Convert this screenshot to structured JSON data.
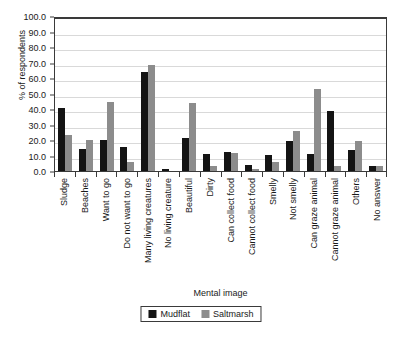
{
  "chart_data": {
    "type": "bar",
    "title": "",
    "xlabel": "Mental image",
    "ylabel": "% of respondents",
    "ylim": [
      0,
      100
    ],
    "ytick_step": 10,
    "ytick_labels": [
      "100.0",
      "90.0",
      "80.0",
      "70.0",
      "60.0",
      "50.0",
      "40.0",
      "30.0",
      "20.0",
      "10.0",
      "0.0"
    ],
    "ytick_values": [
      100,
      90,
      80,
      70,
      60,
      50,
      40,
      30,
      20,
      10,
      0
    ],
    "grid": true,
    "legend_position": "bottom-center",
    "categories": [
      "Sludge",
      "Beaches",
      "Want to go",
      "Do not want to go",
      "Many living creatures",
      "No living creature",
      "Beautiful",
      "Dirty",
      "Can collect food",
      "Cannot collect food",
      "Smelly",
      "Not smelly",
      "Can graze animal",
      "Cannot graze animal",
      "Others",
      "No answer"
    ],
    "series": [
      {
        "name": "Mudflat",
        "color": "#141414",
        "values": [
          40.5,
          14.2,
          20.0,
          15.5,
          64.0,
          1.3,
          21.5,
          11.0,
          12.3,
          4.0,
          10.2,
          19.5,
          11.0,
          39.0,
          13.5,
          3.0
        ]
      },
      {
        "name": "Saltmarsh",
        "color": "#8c8c8c",
        "values": [
          23.5,
          20.0,
          44.5,
          5.8,
          68.5,
          0.0,
          44.0,
          3.5,
          11.5,
          1.0,
          5.5,
          25.5,
          53.0,
          3.5,
          19.5,
          3.2
        ]
      }
    ]
  },
  "legend": {
    "items": [
      {
        "label": "Mudflat",
        "key": "mudflat"
      },
      {
        "label": "Saltmarsh",
        "key": "saltmarsh"
      }
    ]
  }
}
